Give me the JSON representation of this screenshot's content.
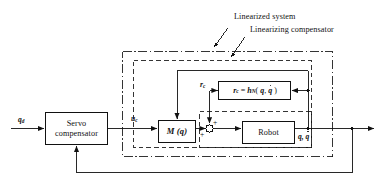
{
  "figure": {
    "type": "control-system-block-diagram",
    "line_color": "#111111",
    "background": "#ffffff"
  },
  "annotations": [
    {
      "id": "linearized-system",
      "label": "Linearized system"
    },
    {
      "id": "linearizing-compensator",
      "label": "Linearizing compensator"
    }
  ],
  "blocks": [
    {
      "id": "servo-compensator",
      "label": "Servo\ncompensator"
    },
    {
      "id": "inertia-matrix",
      "label": "M ( q )"
    },
    {
      "id": "nonlinear-compensation",
      "label": "r = h ( q, q̇ )"
    },
    {
      "id": "robot",
      "label": "Robot"
    }
  ],
  "signals": {
    "reference_input": {
      "base": "q",
      "sub": "d"
    },
    "control_input": {
      "base": "u",
      "sub": "c"
    },
    "compensation_signal": {
      "base": "r",
      "sub": "c"
    },
    "plant_output": "q, q̇"
  },
  "summing_junction": {
    "id": "summing-junction",
    "signs": [
      "+",
      "+"
    ]
  },
  "equation": {
    "lhs_base": "r",
    "lhs_sub": "c",
    "equals": "=",
    "rhs_fn_base": "h",
    "rhs_fn_sub": "N",
    "rhs_args_open": "(",
    "rhs_arg1": "q",
    "rhs_arg_sep": ",",
    "rhs_arg2": "q̇",
    "rhs_args_close": ")"
  },
  "containers": [
    {
      "id": "linearized-system-boundary",
      "style": "dash-dot"
    },
    {
      "id": "linearizing-compensator-boundary",
      "style": "dashed"
    },
    {
      "id": "robot-boundary",
      "style": "dashed"
    }
  ]
}
